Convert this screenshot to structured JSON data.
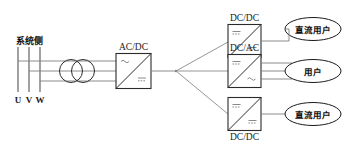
{
  "diagram": {
    "source_side": {
      "label": "系统侧",
      "phases": [
        "U",
        "V",
        "W"
      ]
    },
    "transformer": {
      "name": "transformer-symbol"
    },
    "converters": [
      {
        "id": "ac-dc",
        "label": "AC/DC",
        "label_position": "above",
        "input_type": "ac",
        "output_type": "dc",
        "input_lines": 3,
        "output_lines": 1
      },
      {
        "id": "dc-dc-top",
        "label": "DC/DC",
        "label_position": "above",
        "input_type": "dc",
        "output_type": "dc",
        "input_lines": 1,
        "output_lines": 1
      },
      {
        "id": "dc-ac-mid",
        "label": "DC/AC",
        "label_position": "above",
        "input_type": "dc",
        "output_type": "ac",
        "input_lines": 1,
        "output_lines": 3
      },
      {
        "id": "dc-dc-bottom",
        "label": "DC/DC",
        "label_position": "below",
        "input_type": "dc",
        "output_type": "dc",
        "input_lines": 1,
        "output_lines": 1
      }
    ],
    "loads": [
      {
        "id": "load-top",
        "label": "直流用户"
      },
      {
        "id": "load-mid",
        "label": "用户"
      },
      {
        "id": "load-bottom",
        "label": "直流用户"
      }
    ],
    "colors": {
      "wire": "#808080",
      "box_stroke": "#2b2b2b",
      "text": "#111111",
      "background": "#ffffff"
    }
  }
}
